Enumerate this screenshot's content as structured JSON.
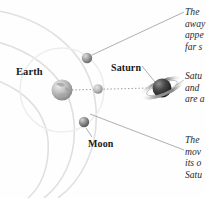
{
  "figure": {
    "type": "astronomy-diagram",
    "title_visible": false,
    "background_color": "#fefefe"
  },
  "bodies": [
    {
      "name": "Earth",
      "label": "Earth",
      "label_x": 16,
      "label_y": 66,
      "center_x": 62,
      "center_y": 90,
      "radius": 10.5,
      "fill": "#b9b9b9",
      "highlight": "#e6e6e6",
      "shadow": "#7c7c7c"
    },
    {
      "name": "Moon-upper",
      "label": "",
      "center_x": 87,
      "center_y": 58,
      "radius": 5.2,
      "fill": "#9a9a9a",
      "highlight": "#dcdcdc",
      "shadow": "#5d5d5d"
    },
    {
      "name": "Moon-middle",
      "label": "",
      "center_x": 98,
      "center_y": 89,
      "radius": 4.8,
      "fill": "#b5b5b5",
      "highlight": "#e4e4e4",
      "shadow": "#777777"
    },
    {
      "name": "Moon-lower",
      "label": "Moon",
      "label_x": 88,
      "label_y": 138,
      "center_x": 84,
      "center_y": 122,
      "radius": 5.2,
      "fill": "#8f8f8f",
      "highlight": "#d6d6d6",
      "shadow": "#545454"
    },
    {
      "name": "Saturn",
      "label": "Saturn",
      "label_x": 111,
      "label_y": 62,
      "center_x": 162,
      "center_y": 88,
      "radius": 9.5,
      "fill": "#3a3a3a",
      "highlight": "#8a8a8a",
      "shadow": "#161616",
      "ring_color": "#8e8e8e",
      "ring_rx": 22,
      "ring_ry": 6.5,
      "ring_tilt_deg": -22
    }
  ],
  "sight_line": {
    "style": "dotted",
    "color": "#9a9a9a",
    "from_x": 72,
    "from_y": 90,
    "to_x": 150,
    "to_y": 88
  },
  "orbit_arcs": {
    "color": "#dedede",
    "count": 3,
    "description": "faint concentric orbital arcs"
  },
  "moon_orbit_circle": {
    "color": "#ebebeb",
    "center_x": 62,
    "center_y": 90,
    "radius": 42
  },
  "leader_lines": {
    "color": "#888888",
    "lines": [
      {
        "name": "top-callout-leader",
        "x1": 92,
        "y1": 55,
        "x2": 183,
        "y2": 12
      },
      {
        "name": "saturn-label-leader",
        "x1": 142,
        "y1": 66,
        "x2": 154,
        "y2": 82
      },
      {
        "name": "saturn-callout-leader",
        "x1": 176,
        "y1": 86,
        "x2": 183,
        "y2": 80
      },
      {
        "name": "bottom-callout-leader",
        "x1": 90,
        "y1": 114,
        "x2": 183,
        "y2": 150
      },
      {
        "name": "moon-label-leader",
        "x1": 86,
        "y1": 128,
        "x2": 92,
        "y2": 137
      }
    ]
  },
  "callouts": [
    {
      "name": "callout-top",
      "clipped": true,
      "lines": [
        "The",
        "away",
        "appe",
        "far s"
      ]
    },
    {
      "name": "callout-middle",
      "clipped": true,
      "lines": [
        "Satu",
        "and",
        "are a"
      ]
    },
    {
      "name": "callout-bottom",
      "clipped": true,
      "lines": [
        "The",
        "mov",
        "its o",
        "Satu"
      ]
    }
  ]
}
